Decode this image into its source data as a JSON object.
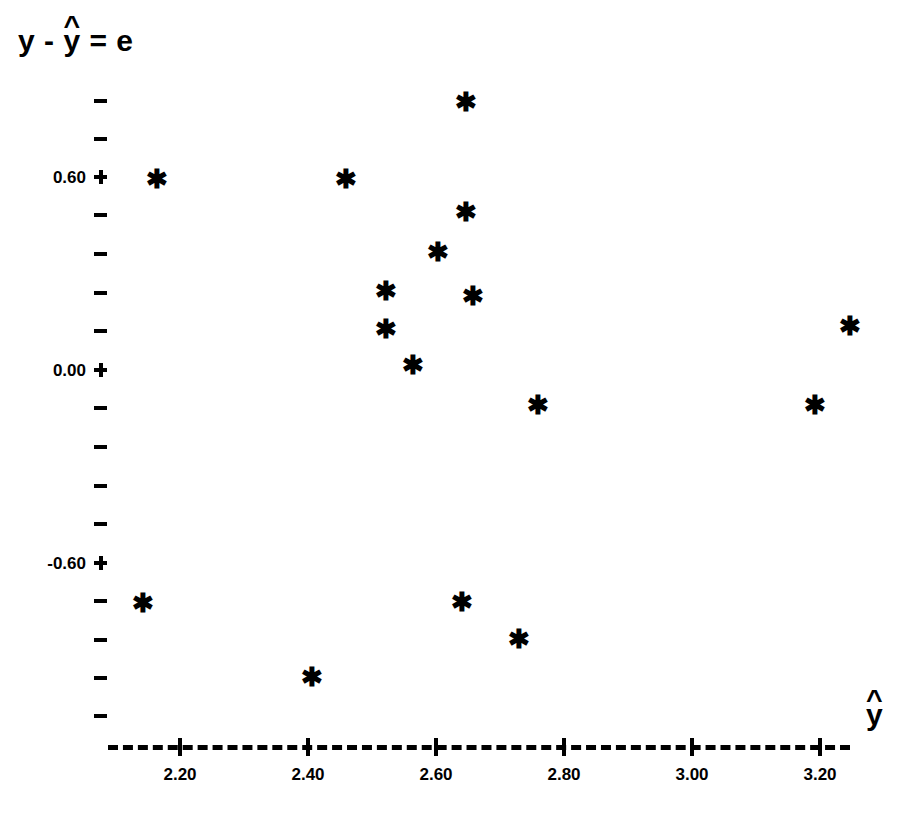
{
  "figure": {
    "title": "",
    "background_color": "#ffffff",
    "ink_color": "#000000"
  },
  "axes": {
    "y_title_parts": {
      "y_observed": "y",
      "minus": "-",
      "y_fitted": "y",
      "y_fitted_hat": "^",
      "equals": "=",
      "residual": "e"
    },
    "y_title_text": "y - ŷ = e",
    "x_title_parts": {
      "base": "y",
      "hat": "^"
    },
    "x_title_text": "ŷ"
  },
  "chart_data": {
    "type": "scatter",
    "title": "",
    "xlabel": "ŷ",
    "ylabel": "y - ŷ = e",
    "grid": false,
    "legend": "none",
    "marker": "asterisk",
    "marker_color": "#000000",
    "xlim": [
      2.11,
      3.3
    ],
    "ylim": [
      -0.9,
      0.86
    ],
    "x_tick_labels": [
      "2.20",
      "2.40",
      "2.60",
      "2.80",
      "3.00",
      "3.20"
    ],
    "x_tick_values": [
      2.2,
      2.4,
      2.6,
      2.8,
      3.0,
      3.2
    ],
    "x_tick_step": 0.2,
    "y_tick_labels": [
      "0.60",
      "0.00",
      "-0.60"
    ],
    "y_tick_values": [
      0.6,
      0.0,
      -0.6
    ],
    "y_minor_tick_step": 0.12,
    "y_minor_tick_values": [
      0.84,
      0.72,
      0.48,
      0.36,
      0.24,
      0.12,
      -0.12,
      -0.24,
      -0.36,
      -0.48,
      -0.72,
      -0.84
    ],
    "x_axis_style": "dashed",
    "n_points": 18,
    "points": [
      {
        "x": 2.16,
        "y": 0.59
      },
      {
        "x": 2.46,
        "y": 0.59
      },
      {
        "x": 2.65,
        "y": 0.83
      },
      {
        "x": 2.65,
        "y": 0.49
      },
      {
        "x": 2.61,
        "y": 0.36
      },
      {
        "x": 2.52,
        "y": 0.25
      },
      {
        "x": 2.65,
        "y": 0.23
      },
      {
        "x": 2.52,
        "y": 0.13
      },
      {
        "x": 2.56,
        "y": 0.02
      },
      {
        "x": 3.24,
        "y": 0.14
      },
      {
        "x": 2.76,
        "y": -0.11
      },
      {
        "x": 3.19,
        "y": -0.11
      },
      {
        "x": 2.14,
        "y": -0.72
      },
      {
        "x": 2.64,
        "y": -0.72
      },
      {
        "x": 2.73,
        "y": -0.84
      },
      {
        "x": 2.41,
        "y": -0.95
      },
      {
        "x": 2.52,
        "y": 0.25
      },
      {
        "x": 2.61,
        "y": 0.36
      }
    ]
  },
  "points_px": [
    {
      "left": 157,
      "top": 179
    },
    {
      "left": 346,
      "top": 179
    },
    {
      "left": 466,
      "top": 102
    },
    {
      "left": 466,
      "top": 212
    },
    {
      "left": 438,
      "top": 252
    },
    {
      "left": 386,
      "top": 291
    },
    {
      "left": 473,
      "top": 296
    },
    {
      "left": 386,
      "top": 329
    },
    {
      "left": 413,
      "top": 365
    },
    {
      "left": 850,
      "top": 326
    },
    {
      "left": 538,
      "top": 405
    },
    {
      "left": 815,
      "top": 405
    },
    {
      "left": 143,
      "top": 603
    },
    {
      "left": 462,
      "top": 602
    },
    {
      "left": 519,
      "top": 639
    },
    {
      "left": 312,
      "top": 677
    }
  ],
  "y_ticks_px": [
    {
      "top": 101,
      "label": null,
      "major": false
    },
    {
      "top": 139,
      "label": null,
      "major": false
    },
    {
      "top": 177,
      "label": "0.60",
      "major": true
    },
    {
      "top": 215,
      "label": null,
      "major": false
    },
    {
      "top": 254,
      "label": null,
      "major": false
    },
    {
      "top": 293,
      "label": null,
      "major": false
    },
    {
      "top": 331,
      "label": null,
      "major": false
    },
    {
      "top": 370,
      "label": "0.00",
      "major": true
    },
    {
      "top": 408,
      "label": null,
      "major": false
    },
    {
      "top": 447,
      "label": null,
      "major": false
    },
    {
      "top": 486,
      "label": null,
      "major": false
    },
    {
      "top": 524,
      "label": null,
      "major": false
    },
    {
      "top": 563,
      "label": "-0.60",
      "major": true
    },
    {
      "top": 601,
      "label": null,
      "major": false
    },
    {
      "top": 640,
      "label": null,
      "major": false
    },
    {
      "top": 678,
      "label": null,
      "major": false
    },
    {
      "top": 716,
      "label": null,
      "major": false
    }
  ],
  "x_ticks_px": [
    {
      "left": 180,
      "label": "2.20"
    },
    {
      "left": 308,
      "label": "2.40"
    },
    {
      "left": 436,
      "label": "2.60"
    },
    {
      "left": 564,
      "label": "2.80"
    },
    {
      "left": 692,
      "label": "3.00"
    },
    {
      "left": 820,
      "label": "3.20"
    }
  ]
}
